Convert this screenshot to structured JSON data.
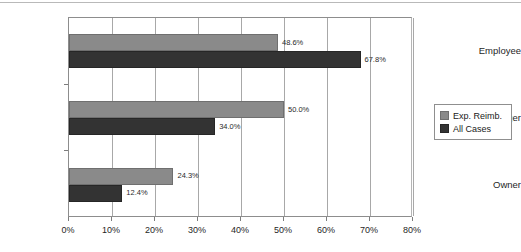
{
  "chart_data": {
    "type": "bar",
    "orientation": "horizontal",
    "title": "",
    "xlabel": "",
    "ylabel": "",
    "categories": [
      "Employee",
      "Manager",
      "Owner"
    ],
    "series": [
      {
        "name": "Exp. Reimb.",
        "color": "#8a8a8a",
        "values": [
          48.6,
          50.0,
          24.3
        ],
        "labels": [
          "48.6%",
          "50.0%",
          "24.3%"
        ]
      },
      {
        "name": "All Cases",
        "color": "#333333",
        "values": [
          67.8,
          34.0,
          12.4
        ],
        "labels": [
          "67.8%",
          "34.0%",
          "12.4%"
        ]
      }
    ],
    "xlim": [
      0,
      80
    ],
    "xticks": [
      0,
      10,
      20,
      30,
      40,
      50,
      60,
      70,
      80
    ],
    "xtick_labels": [
      "0%",
      "10%",
      "20%",
      "30%",
      "40%",
      "50%",
      "60%",
      "70%",
      "80%"
    ],
    "grid": "vertical",
    "legend_position": "right"
  },
  "legend": {
    "items": [
      {
        "label": "Exp. Reimb."
      },
      {
        "label": "All Cases"
      }
    ]
  }
}
